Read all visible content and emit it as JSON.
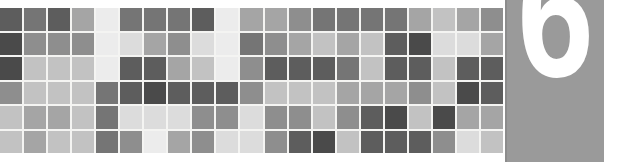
{
  "banner": {
    "width": 636,
    "height": 162,
    "background_color": "#ffffff",
    "kind": "chapter-opener-banner"
  },
  "number_panel": {
    "number": "6",
    "number_color": "#ffffff",
    "panel_color": "#9a9a9a",
    "panel_edge_color": "#8c8c8c"
  },
  "mosaic": {
    "columns": 21,
    "rows": 6,
    "gridline_color": "#f4f4f2",
    "palette": {
      "very_dark": "#4a4a4a",
      "dark": "#5d5d5d",
      "mid_dark": "#757575",
      "mid": "#8e8e8e",
      "mid_light": "#a5a5a5",
      "light": "#c2c2c2",
      "very_light": "#dcdcdc",
      "near_white": "#ececec"
    }
  },
  "chart_data": {
    "type": "heatmap",
    "title": "",
    "xlabel": "",
    "ylabel": "",
    "grid": true,
    "legend": "none",
    "columns": 21,
    "rows": 6,
    "colorscale": [
      "#4a4a4a",
      "#5d5d5d",
      "#757575",
      "#8e8e8e",
      "#a5a5a5",
      "#c2c2c2",
      "#dcdcdc",
      "#ececec"
    ],
    "values": [
      [
        "#5d5d5d",
        "#757575",
        "#5d5d5d",
        "#a5a5a5",
        "#ececec",
        "#757575",
        "#757575",
        "#757575",
        "#5d5d5d",
        "#ececec",
        "#a5a5a5",
        "#a5a5a5",
        "#8e8e8e",
        "#757575",
        "#757575",
        "#757575",
        "#757575",
        "#a5a5a5",
        "#c2c2c2",
        "#a5a5a5",
        "#8e8e8e"
      ],
      [
        "#4a4a4a",
        "#8e8e8e",
        "#8e8e8e",
        "#8e8e8e",
        "#ececec",
        "#dcdcdc",
        "#a5a5a5",
        "#8e8e8e",
        "#dcdcdc",
        "#ececec",
        "#757575",
        "#8e8e8e",
        "#a5a5a5",
        "#c2c2c2",
        "#a5a5a5",
        "#c2c2c2",
        "#5d5d5d",
        "#4a4a4a",
        "#dcdcdc",
        "#dcdcdc",
        "#a5a5a5"
      ],
      [
        "#4a4a4a",
        "#c2c2c2",
        "#c2c2c2",
        "#c2c2c2",
        "#ececec",
        "#5d5d5d",
        "#5d5d5d",
        "#a5a5a5",
        "#c2c2c2",
        "#ececec",
        "#8e8e8e",
        "#5d5d5d",
        "#5d5d5d",
        "#5d5d5d",
        "#757575",
        "#c2c2c2",
        "#5d5d5d",
        "#5d5d5d",
        "#c2c2c2",
        "#5d5d5d",
        "#5d5d5d"
      ],
      [
        "#8e8e8e",
        "#c2c2c2",
        "#c2c2c2",
        "#c2c2c2",
        "#757575",
        "#5d5d5d",
        "#4a4a4a",
        "#5d5d5d",
        "#5d5d5d",
        "#5d5d5d",
        "#8e8e8e",
        "#c2c2c2",
        "#c2c2c2",
        "#c2c2c2",
        "#a5a5a5",
        "#a5a5a5",
        "#a5a5a5",
        "#8e8e8e",
        "#c2c2c2",
        "#4a4a4a",
        "#5d5d5d"
      ],
      [
        "#c2c2c2",
        "#a5a5a5",
        "#a5a5a5",
        "#c2c2c2",
        "#757575",
        "#dcdcdc",
        "#dcdcdc",
        "#dcdcdc",
        "#8e8e8e",
        "#8e8e8e",
        "#dcdcdc",
        "#8e8e8e",
        "#8e8e8e",
        "#c2c2c2",
        "#8e8e8e",
        "#5d5d5d",
        "#4a4a4a",
        "#c2c2c2",
        "#4a4a4a",
        "#a5a5a5",
        "#a5a5a5"
      ],
      [
        "#c2c2c2",
        "#a5a5a5",
        "#c2c2c2",
        "#c2c2c2",
        "#757575",
        "#8e8e8e",
        "#ececec",
        "#a5a5a5",
        "#8e8e8e",
        "#dcdcdc",
        "#dcdcdc",
        "#8e8e8e",
        "#5d5d5d",
        "#4a4a4a",
        "#c2c2c2",
        "#5d5d5d",
        "#5d5d5d",
        "#5d5d5d",
        "#8e8e8e",
        "#dcdcdc",
        "#c2c2c2"
      ]
    ]
  }
}
